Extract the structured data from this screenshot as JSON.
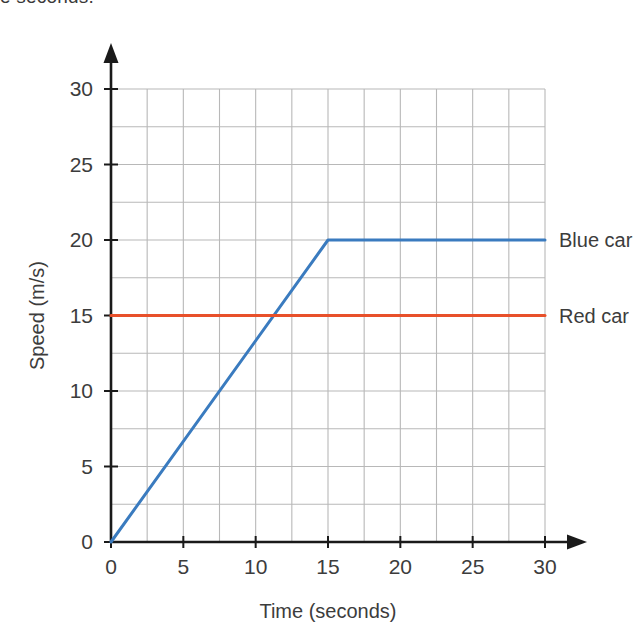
{
  "page": {
    "top_text_fragment": "e seconds."
  },
  "chart_data": {
    "type": "line",
    "title": "",
    "xlabel": "Time (seconds)",
    "ylabel": "Speed (m/s)",
    "xlim": [
      0,
      30
    ],
    "ylim": [
      0,
      30
    ],
    "xticks": [
      "0",
      "5",
      "10",
      "15",
      "20",
      "25",
      "30"
    ],
    "ytick_values": [
      0,
      5,
      10,
      15,
      20,
      25,
      30
    ],
    "yticks": [
      "0",
      "5",
      "10",
      "15",
      "20",
      "25",
      "30"
    ],
    "xtick_values": [
      0,
      5,
      10,
      15,
      20,
      25,
      30
    ],
    "grid": true,
    "grid_step_x": 2.5,
    "grid_step_y": 2.5,
    "grid_color": "#b8b8b8",
    "axis_color": "#1a1a1a",
    "legend_position": "right-inline",
    "series": [
      {
        "name": "Blue car",
        "color": "#3a7bbf",
        "points": [
          [
            0,
            0
          ],
          [
            15,
            20
          ],
          [
            30,
            20
          ]
        ],
        "label_at": [
          30,
          20
        ]
      },
      {
        "name": "Red car",
        "color": "#e8502a",
        "points": [
          [
            0,
            15
          ],
          [
            30,
            15
          ]
        ],
        "label_at": [
          30,
          15
        ]
      }
    ]
  }
}
